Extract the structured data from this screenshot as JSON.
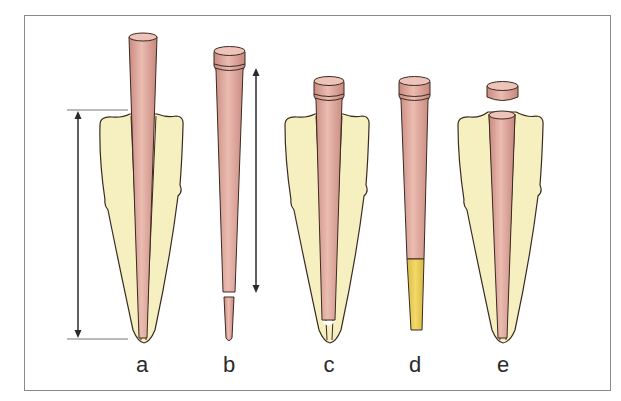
{
  "figure": {
    "panel_labels": [
      "a",
      "b",
      "c",
      "d",
      "e"
    ],
    "colors": {
      "tooth_fill": "#f6efbf",
      "cone_fill": "#d9a095",
      "cone_highlight": "#eab9ae",
      "sealer_tip": "#ecd060",
      "outline": "#3a2a22",
      "frame": "#8a8a8a",
      "arrow": "#2a2a2a"
    },
    "panels": [
      {
        "id": "a",
        "description": "Gutta-percha cone inserted in root canal; measured length with arrow"
      },
      {
        "id": "b",
        "description": "Cone shown outside tooth with measured length arrow and cut apical tip"
      },
      {
        "id": "c",
        "description": "Trimmed cone seated in root canal short of apex"
      },
      {
        "id": "d",
        "description": "Cone with yellow coated apical portion"
      },
      {
        "id": "e",
        "description": "Cone seated in canal with coronal cap separated above"
      }
    ]
  }
}
